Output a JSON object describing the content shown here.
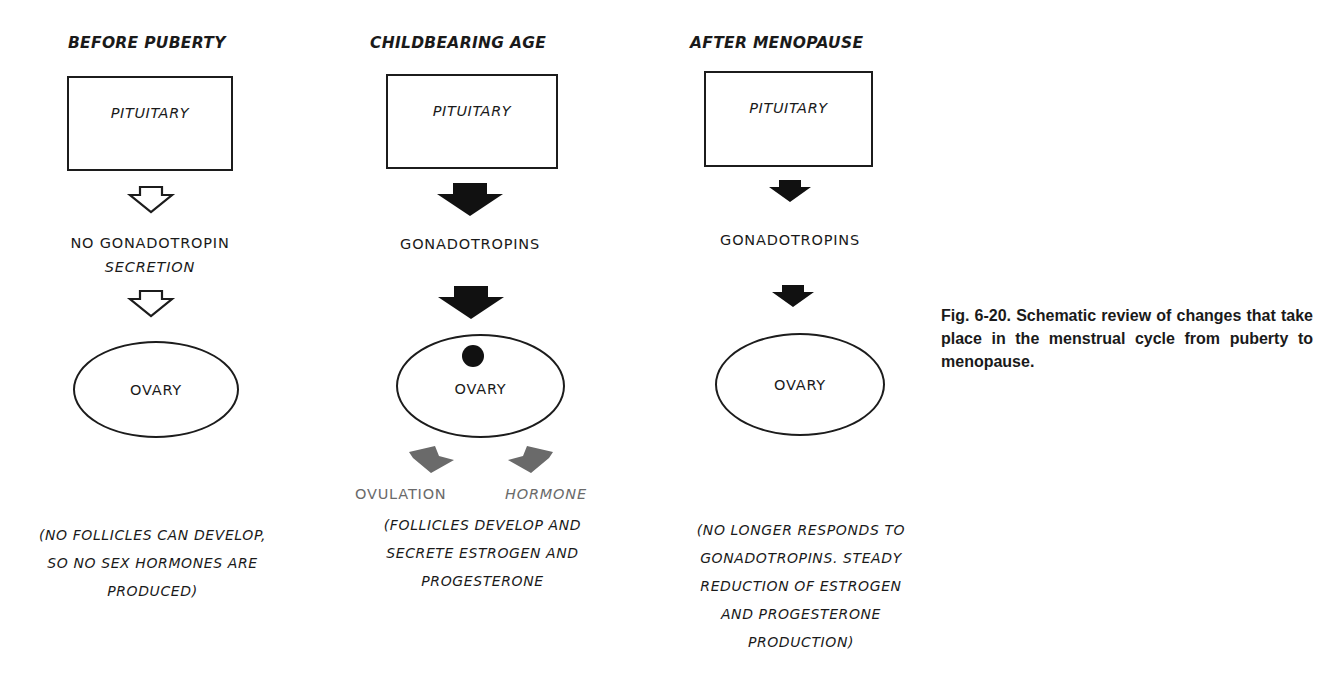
{
  "columns": [
    {
      "title": "BEFORE PUBERTY",
      "box_label": "PITUITARY",
      "secretion_label_lines": [
        "NO GONADOTROPIN",
        "SECRETION"
      ],
      "arrow_style": "outline",
      "organ_label": "OVARY",
      "follicle_present": false,
      "outputs": [],
      "note_lines": [
        "(NO FOLLICLES CAN DEVELOP,",
        "SO NO SEX HORMONES ARE",
        "PRODUCED)"
      ]
    },
    {
      "title": "CHILDBEARING AGE",
      "box_label": "PITUITARY",
      "secretion_label_lines": [
        "GONADOTROPINS"
      ],
      "arrow_style": "solid-large",
      "organ_label": "OVARY",
      "follicle_present": true,
      "outputs": [
        "OVULATION",
        "HORMONE"
      ],
      "note_lines": [
        "(FOLLICLES DEVELOP AND",
        "SECRETE ESTROGEN AND",
        "PROGESTERONE"
      ]
    },
    {
      "title": "AFTER MENOPAUSE",
      "box_label": "PITUITARY",
      "secretion_label_lines": [
        "GONADOTROPINS"
      ],
      "arrow_style": "solid-small",
      "organ_label": "OVARY",
      "follicle_present": false,
      "outputs": [],
      "note_lines": [
        "(NO LONGER RESPONDS TO",
        "GONADOTROPINS. STEADY",
        "REDUCTION OF ESTROGEN",
        "AND PROGESTERONE",
        "PRODUCTION)"
      ]
    }
  ],
  "caption": "Fig. 6-20. Schematic review of changes that take place in the menstrual cycle from puberty to menopause.",
  "colors": {
    "ink": "#1a1a1a",
    "output_arrow": "#6a6a6a",
    "background": "#ffffff"
  }
}
